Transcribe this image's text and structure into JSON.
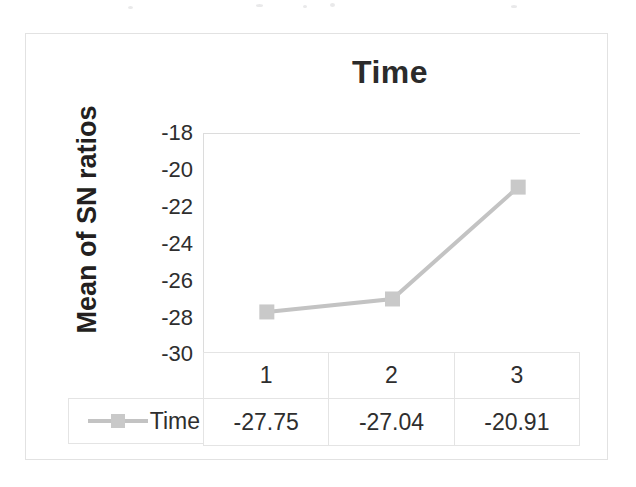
{
  "figure": {
    "title": "Time",
    "y_axis_title": "Mean of SN ratios"
  },
  "chart_data": {
    "type": "line",
    "title": "Time",
    "xlabel": "",
    "ylabel": "Mean of SN ratios",
    "categories": [
      "1",
      "2",
      "3"
    ],
    "series": [
      {
        "name": "Time",
        "values": [
          -27.75,
          -27.04,
          -20.91
        ],
        "color": "#c3c3c3",
        "marker": "square"
      }
    ],
    "yticks": [
      -18,
      -20,
      -22,
      -24,
      -26,
      -28,
      -30
    ],
    "ytick_labels": [
      "-18",
      "-20",
      "-22",
      "-24",
      "-26",
      "-28",
      "-30"
    ],
    "ylim": [
      -30,
      -18
    ],
    "grid": false,
    "legend_position": "table-left",
    "data_table": {
      "header_row": [
        "1",
        "2",
        "3"
      ],
      "value_row_label": "Time",
      "value_row": [
        "-27.75",
        "-27.04",
        "-20.91"
      ]
    }
  },
  "colors": {
    "series": "#c3c3c3",
    "marker": "#c9c9c9",
    "text": "#2e2e2e",
    "border": "#e4e4e4",
    "frame": "#e2e2e2"
  }
}
